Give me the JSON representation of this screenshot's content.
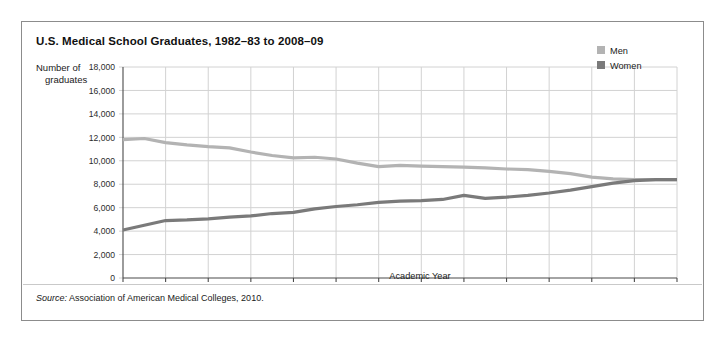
{
  "figure": {
    "title": "U.S. Medical School Graduates, 1982–83 to 2008–09",
    "source_label": "Source:",
    "source_text": " Association of American Medical Colleges, 2010."
  },
  "chart_data": {
    "type": "line",
    "title": "U.S. Medical School Graduates, 1982–83 to 2008–09",
    "xlabel": "Academic Year",
    "ylabel_line1": "Number of",
    "ylabel_line2": "graduates",
    "ylim": [
      0,
      18000
    ],
    "ytick_step": 2000,
    "ytick_labels": [
      "18,000",
      "16,000",
      "14,000",
      "12,000",
      "10,000",
      "8,000",
      "6,000",
      "4,000",
      "2,000",
      "0"
    ],
    "ytick_values": [
      18000,
      16000,
      14000,
      12000,
      10000,
      8000,
      6000,
      4000,
      2000,
      0
    ],
    "grid": true,
    "legend_position": "top-right",
    "x": [
      "1982–83",
      "1983–84",
      "1984–85",
      "1985–86",
      "1986–87",
      "1987–88",
      "1988–89",
      "1989–90",
      "1990–91",
      "1991–92",
      "1992–93",
      "1993–94",
      "1994–95",
      "1995–96",
      "1996–97",
      "1997–98",
      "1998–99",
      "1999–00",
      "2000–01",
      "2001–02",
      "2002–03",
      "2003–04",
      "2004–05",
      "2005–06",
      "2006–07",
      "2007–08",
      "2008–09"
    ],
    "xtick_labels": [
      "1982–83",
      "1984–85",
      "1986–87",
      "1988–89",
      "1990–91",
      "1992–93",
      "1994–95",
      "1996–97",
      "1998–99",
      "2000–01",
      "2002–03",
      "2004–05",
      "2006–07",
      "2008–09"
    ],
    "xtick_every": 2,
    "series": [
      {
        "name": "Men",
        "color": "#b3b3b3",
        "values": [
          11800,
          11900,
          11550,
          11350,
          11200,
          11100,
          10750,
          10450,
          10250,
          10300,
          10150,
          9800,
          9500,
          9600,
          9550,
          9500,
          9450,
          9400,
          9300,
          9250,
          9100,
          8900,
          8600,
          8450,
          8400,
          8400,
          8400
        ]
      },
      {
        "name": "Women",
        "color": "#7a7a7a",
        "values": [
          4100,
          4500,
          4900,
          4950,
          5050,
          5200,
          5300,
          5500,
          5600,
          5900,
          6100,
          6250,
          6450,
          6550,
          6600,
          6700,
          7050,
          6800,
          6900,
          7050,
          7250,
          7500,
          7800,
          8100,
          8300,
          8400,
          8400
        ]
      }
    ]
  },
  "legend": {
    "items": [
      {
        "label": "Men",
        "color": "#b3b3b3"
      },
      {
        "label": "Women",
        "color": "#7a7a7a"
      }
    ]
  }
}
